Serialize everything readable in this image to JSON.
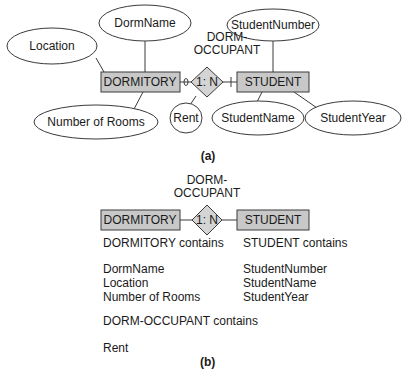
{
  "diagram_a": {
    "caption": "(a)",
    "relationship": {
      "name_line1": "DORM-",
      "name_line2": "OCCUPANT",
      "cardinality": "1: N"
    },
    "entities": {
      "dormitory": "DORMITORY",
      "student": "STUDENT"
    },
    "attributes": {
      "dorm_name": "DormName",
      "location": "Location",
      "number_of_rooms": "Number of Rooms",
      "rent": "Rent",
      "student_number": "StudentNumber",
      "student_name": "StudentName",
      "student_year": "StudentYear"
    }
  },
  "diagram_b": {
    "caption": "(b)",
    "relationship": {
      "name_line1": "DORM-",
      "name_line2": "OCCUPANT",
      "cardinality": "1: N"
    },
    "entities": {
      "dormitory": "DORMITORY",
      "student": "STUDENT"
    },
    "dormitory_contains": "DORMITORY contains",
    "dormitory_attributes": [
      "DormName",
      "Location",
      "Number of Rooms"
    ],
    "student_contains": "STUDENT contains",
    "student_attributes": [
      "StudentNumber",
      "StudentName",
      "StudentYear"
    ],
    "relationship_contains": "DORM-OCCUPANT contains",
    "relationship_attributes": [
      "Rent"
    ]
  },
  "colors": {
    "entity_fill": "#c8c8c8",
    "relationship_fill": "#d4d4d4",
    "stroke": "#3a3a3a"
  }
}
